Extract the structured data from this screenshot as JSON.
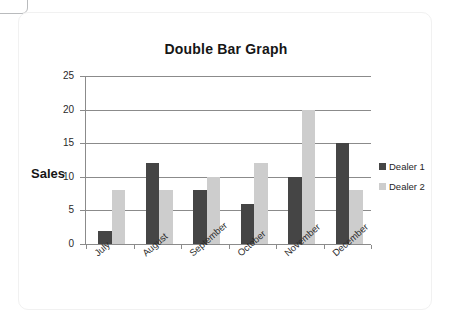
{
  "chart_data": {
    "type": "bar",
    "title": "Double Bar Graph",
    "xlabel": "",
    "ylabel": "Sales",
    "ylim": [
      0,
      25
    ],
    "yticks": [
      0,
      5,
      10,
      15,
      20,
      25
    ],
    "grid": true,
    "legend_position": "right",
    "categories": [
      "July",
      "August",
      "September",
      "October",
      "November",
      "December"
    ],
    "series": [
      {
        "name": "Dealer 1",
        "color": "#454545",
        "values": [
          2,
          12,
          8,
          6,
          10,
          15
        ]
      },
      {
        "name": "Dealer 2",
        "color": "#cdcdcd",
        "values": [
          8,
          8,
          10,
          12,
          20,
          8
        ]
      }
    ]
  }
}
